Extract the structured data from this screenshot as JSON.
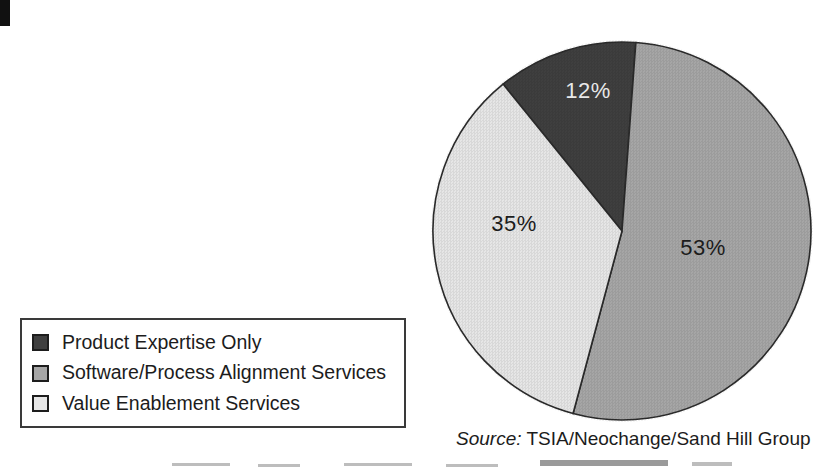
{
  "chart_data": {
    "type": "pie",
    "title": "",
    "categories": [
      "Product Expertise Only",
      "Software/Process Alignment Services",
      "Value Enablement Services"
    ],
    "values": [
      12,
      53,
      35
    ],
    "unit": "%",
    "slices": [
      {
        "label": "Product Expertise Only",
        "value": 12,
        "display": "12%",
        "color": "#3f3f3f",
        "label_color": "#e8e8e8",
        "label_xy": [
          588,
          91
        ]
      },
      {
        "label": "Software/Process Alignment Services",
        "value": 53,
        "display": "53%",
        "color": "#a6a6a6",
        "label_color": "#1c1c1c",
        "label_xy": [
          703,
          248
        ]
      },
      {
        "label": "Value Enablement Services",
        "value": 35,
        "display": "35%",
        "color": "#e6e6e6",
        "label_color": "#1c1c1c",
        "label_xy": [
          514,
          224
        ]
      }
    ],
    "start_angle_deg": -39,
    "direction": "clockwise",
    "stroke_color": "#2b2b2b",
    "legend_position": "bottom-left",
    "source": "TSIA/Neochange/Sand Hill Group"
  },
  "source_note": {
    "prefix": "Source:",
    "text": " TSIA/Neochange/Sand Hill Group"
  }
}
